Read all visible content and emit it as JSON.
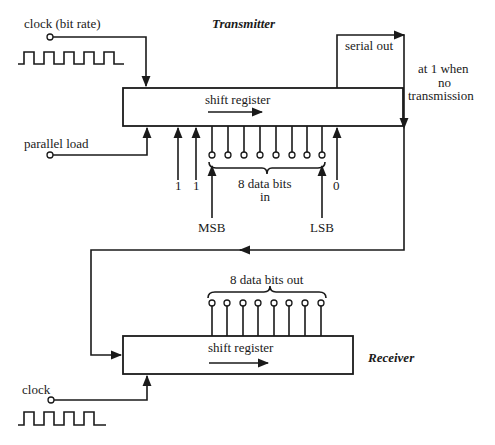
{
  "transmitter": {
    "title": "Transmitter",
    "register_label": "shift register",
    "clock_label": "clock (bit rate)",
    "parallel_load_label": "parallel load",
    "serial_out_label": "serial out",
    "idle_note": [
      "at 1 when",
      "no",
      "transmission"
    ],
    "fixed_bits": [
      "1",
      "1"
    ],
    "end_bit": "0",
    "data_label": [
      "8 data bits",
      "in"
    ],
    "msb_label": "MSB",
    "lsb_label": "LSB",
    "data_pin_count": 8
  },
  "receiver": {
    "title": "Receiver",
    "register_label": "shift register",
    "clock_label": "clock",
    "data_label": "8 data bits out",
    "data_pin_count": 8
  },
  "colors": {
    "ink": "#1a1a1a",
    "background": "#ffffff"
  }
}
